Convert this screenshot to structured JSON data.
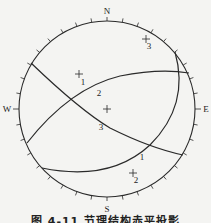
{
  "diagram": {
    "type": "stereographic-projection",
    "directions": {
      "north": "N",
      "south": "S",
      "east": "E",
      "west": "W"
    },
    "great_circles": [
      {
        "id": "1",
        "label": "1"
      },
      {
        "id": "2",
        "label": "2"
      },
      {
        "id": "3",
        "label": "3"
      }
    ],
    "poles": [
      {
        "id": "1",
        "label": "1"
      },
      {
        "id": "2",
        "label": "2"
      },
      {
        "id": "3",
        "label": "3"
      }
    ],
    "colors": {
      "line": "#2a2a2a",
      "background": "#f4f4f2"
    }
  },
  "caption": "图 4-11  节理结构赤平投影"
}
